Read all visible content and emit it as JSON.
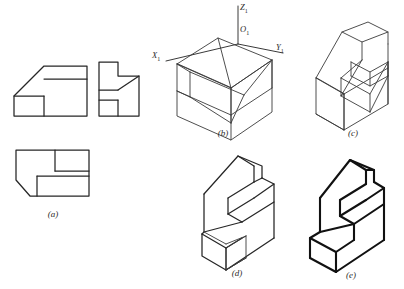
{
  "figure": {
    "panel_count": 5,
    "background_color": "#ffffff",
    "line_color": "#262626",
    "construction_line_color": "#3a3a3a"
  },
  "captions": {
    "a": "(a)",
    "b": "(b)",
    "c": "(c)",
    "d": "(d)",
    "e": "(e)"
  },
  "axes": {
    "z_label": "Z",
    "z_sub": "1",
    "o_label": "O",
    "o_sub": "1",
    "x_label": "X",
    "x_sub": "1",
    "y_label": "Y",
    "y_sub": "1"
  },
  "panels": [
    {
      "id": "a",
      "name": "orthographic-views",
      "description": "Three orthographic views: front view with chamfer, side view L-shape with diagonal, top view with chamfered corner",
      "views": [
        "front-view",
        "side-view",
        "top-view"
      ]
    },
    {
      "id": "b",
      "name": "axonometric-bounding-box",
      "description": "Isometric bounding box with coordinate axes and construction lines defining the inclined surfaces"
    },
    {
      "id": "c",
      "name": "isometric-with-construction",
      "description": "Isometric solid with visible construction lines for the notch and slot"
    },
    {
      "id": "d",
      "name": "isometric-trimmed",
      "description": "Isometric solid with most construction lines removed, base block outline still visible"
    },
    {
      "id": "e",
      "name": "isometric-final",
      "description": "Final isometric drawing with bold visible outlines only"
    }
  ]
}
